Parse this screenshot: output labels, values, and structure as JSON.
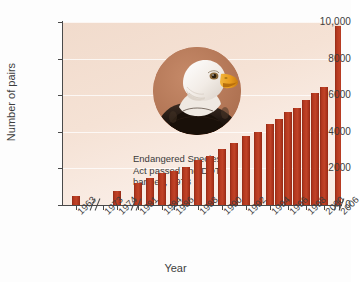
{
  "chart_data": {
    "type": "bar",
    "title": "",
    "xlabel": "Year",
    "ylabel": "Number of pairs",
    "ylim": [
      0,
      10000
    ],
    "yticks": [
      "0",
      "2000",
      "4000",
      "6000",
      "8000",
      "10,000"
    ],
    "ytick_values": [
      0,
      2000,
      4000,
      6000,
      8000,
      10000
    ],
    "grid": true,
    "legend": "none",
    "categories": [
      "1963",
      "1973",
      "1974",
      "1981",
      "1984",
      "1986",
      "1988",
      "1990",
      "1992",
      "1994",
      "1996",
      "1998",
      "2000",
      "2006"
    ],
    "values": [
      487,
      null,
      791,
      1188,
      1757,
      1875,
      2475,
      3035,
      3749,
      4449,
      5094,
      5748,
      6471,
      9789
    ],
    "series": [
      {
        "name": "Bald eagle breeding pairs",
        "points": [
          {
            "year": "1963",
            "value": 487
          },
          {
            "year": "1974",
            "value": 791
          },
          {
            "year": "1981",
            "value": 1188
          },
          {
            "year": "1982",
            "value": 1480
          },
          {
            "year": "1984",
            "value": 1757
          },
          {
            "year": "1986",
            "value": 1875
          },
          {
            "year": "1987",
            "value": 2090
          },
          {
            "year": "1988",
            "value": 2475
          },
          {
            "year": "1989",
            "value": 2680
          },
          {
            "year": "1990",
            "value": 3035
          },
          {
            "year": "1991",
            "value": 3390
          },
          {
            "year": "1992",
            "value": 3749
          },
          {
            "year": "1993",
            "value": 4015
          },
          {
            "year": "1994",
            "value": 4449
          },
          {
            "year": "1995",
            "value": 4712
          },
          {
            "year": "1996",
            "value": 5094
          },
          {
            "year": "1997",
            "value": 5295
          },
          {
            "year": "1998",
            "value": 5748
          },
          {
            "year": "1999",
            "value": 6104
          },
          {
            "year": "2000",
            "value": 6471
          },
          {
            "year": "2006",
            "value": 9789
          }
        ]
      }
    ],
    "axis_breaks": [
      "between 1963 and 1973",
      "between 1974 and 1981",
      "between 2000 and 2006"
    ],
    "annotations": [
      {
        "lines": [
          "Endangered Species",
          "Act passed and DDT",
          "banned, 1973"
        ],
        "points_to_year": "1973"
      }
    ],
    "colors": {
      "bar": "#b0381f",
      "bar_dark_edge": "#8c2a15",
      "plot_background": "#f6e2d5",
      "gridline": "#ffffff",
      "axis": "#4a4a4a",
      "text": "#3d3d3d",
      "photo_background": "#b8785a"
    }
  },
  "inset_image": {
    "name": "bald-eagle-photo",
    "description": "Bald eagle head in profile",
    "shape": "circle"
  },
  "axis_titles": {
    "x": "Year",
    "y": "Number of pairs"
  },
  "annotation_text": {
    "line1": "Endangered Species",
    "line2": "Act passed and DDT",
    "line3": "banned, 1973"
  },
  "ytick_labels": {
    "t0": "0",
    "t2000": "2000",
    "t4000": "4000",
    "t6000": "6000",
    "t8000": "8000",
    "t10000": "10,000"
  },
  "xtick_labels": {
    "l0": "1963",
    "l1": "1973",
    "l2": "1974",
    "l3": "1981",
    "l4": "1984",
    "l5": "1986",
    "l6": "1988",
    "l7": "1990",
    "l8": "1992",
    "l9": "1994",
    "l10": "1996",
    "l11": "1998",
    "l12": "2000",
    "l13": "2006"
  },
  "bottom_caption": ""
}
